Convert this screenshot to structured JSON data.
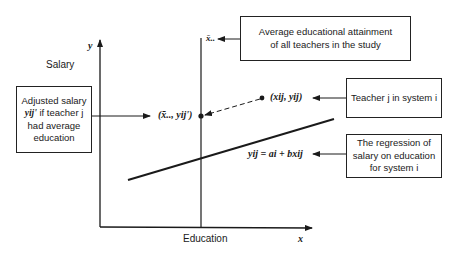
{
  "diagram": {
    "axes": {
      "y_axis_symbol": "y",
      "x_axis_symbol": "x",
      "y_axis_label": "Salary",
      "x_axis_label": "Education"
    },
    "vertical_line_label": "x̄..",
    "points": {
      "adjusted_point_label": "(x̄.., yij')",
      "teacher_point_label": "(xij, yij)"
    },
    "regression_equation": "yij = ai + bxij",
    "boxes": {
      "average_attainment": {
        "line1": "Average educational attainment",
        "line2": "of all teachers in the study"
      },
      "adjusted_salary": {
        "line1": "Adjusted salary",
        "line2_symbol": "yij'",
        "line2_text": "if teacher j",
        "line3": "had average",
        "line4": "education"
      },
      "teacher": {
        "line1": "Teacher j in system i"
      },
      "regression": {
        "line1": "The regression of",
        "line2": "salary on education",
        "line3": "for system i"
      }
    }
  }
}
